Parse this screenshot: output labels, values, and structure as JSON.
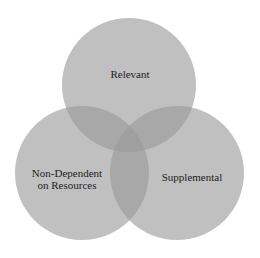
{
  "diagram": {
    "type": "venn",
    "background": "#ffffff",
    "fill_color": "#9a9a9a",
    "fill_opacity": 0.62,
    "circles": [
      {
        "id": "relevant",
        "label": "Relevant",
        "cx": 129,
        "cy": 85,
        "r": 67
      },
      {
        "id": "non_dependent",
        "label_line1": "Non-Dependent",
        "label_line2": "on Resources",
        "cx": 82,
        "cy": 173,
        "r": 67
      },
      {
        "id": "supplemental",
        "label": "Supplemental",
        "cx": 177,
        "cy": 173,
        "r": 67
      }
    ]
  }
}
